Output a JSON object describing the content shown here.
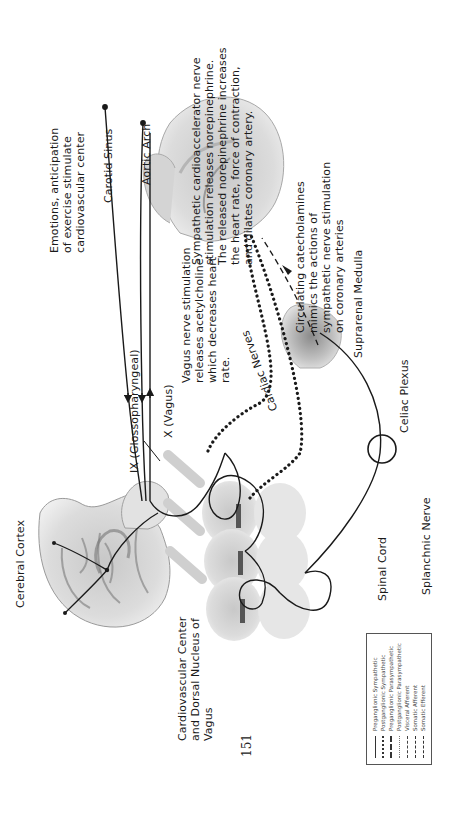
{
  "page": {
    "number": "151",
    "orientation": "rotated -90deg (landscape figure on portrait page)"
  },
  "labels": {
    "cerebral_cortex": "Cerebral Cortex",
    "emotions": [
      "Emotions,  anticipation",
      "of exercise stimulate",
      "cardiovascular center"
    ],
    "carotid_sinus": "Carotid Sinus",
    "aortic_arch": "Aortic Arch",
    "glossopharyngeal": "IX (Glossopharyngeal)",
    "vagus": "X (Vagus)",
    "vagus_note": [
      "Vagus nerve stimulation",
      "releases acetylcholine",
      "which decreases heart",
      "rate."
    ],
    "sympathetic_note": [
      "Sympathetic cardioaccelerator nerve",
      "stimulation releases norepinephrine.",
      "The released norepinephrine increases",
      "the heart rate,  force of contraction,",
      "and dilates coronary artery."
    ],
    "catecholamines_note": [
      "Circulating catecholamines",
      "mimics the actions of",
      "sympathetic nerve stimulation",
      "on coronary arteries"
    ],
    "cardiac_nerves": "Cardiac Nerves",
    "suprarenal_medulla": "Suprarenal Medulla",
    "celiac_plexus": "Celiac Plexus",
    "cardiovascular_center": [
      "Cardiovascular Center",
      "and Dorsal Nucleus of",
      "Vagus"
    ],
    "spinal_cord": "Spinal Cord",
    "splanchnic_nerve": "Splanchnic Nerve"
  },
  "legend": {
    "items": [
      {
        "label": "Preganglionic Sympathetic",
        "style": "solid"
      },
      {
        "label": "Postganglionic Sympathetic",
        "style": "dotted-heavy"
      },
      {
        "label": "Preganglionic Parasympathetic",
        "style": "dashed-heavy"
      },
      {
        "label": "Postganglionic Parasympathetic",
        "style": "dotted-light"
      },
      {
        "label": "Visceral Afferent",
        "style": "dash-dot"
      },
      {
        "label": "Somatic Afferent",
        "style": "dash-dot-heavy"
      },
      {
        "label": "Somatic Efferent",
        "style": "dashed"
      }
    ]
  },
  "colors": {
    "ink": "#1a1a1a",
    "tissue_light": "#d9d9d9",
    "tissue_mid": "#b5b5b5",
    "tissue_dark": "#7a7a7a"
  }
}
